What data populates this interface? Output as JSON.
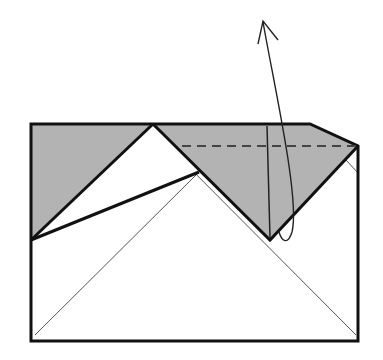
{
  "diagram": {
    "type": "origami-fold-step",
    "colors": {
      "paper_white": "#ffffff",
      "paper_colored": "#b3b3b3",
      "line": "#111111",
      "thin_line": "#555555",
      "dashed_line": "#444444"
    },
    "elements": {
      "sheet_outline": "rectangle sheet outline",
      "left_gray_flap": "left colored triangle flap",
      "right_gray_flap": "right colored flap to be folded",
      "valley_fold_line": "dashed valley fold line",
      "fold_arrow": "curved fold arrow pointing up"
    }
  }
}
